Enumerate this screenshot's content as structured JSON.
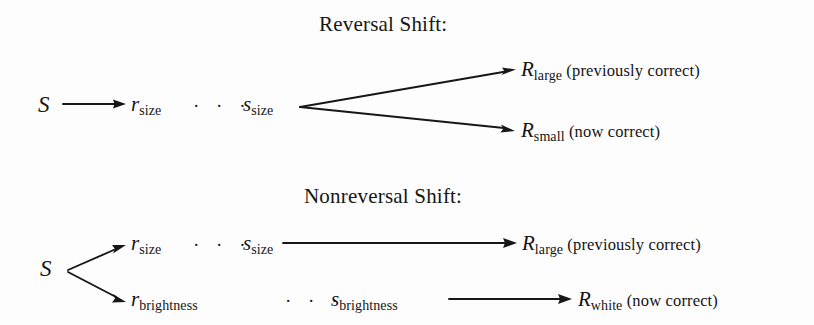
{
  "figure": {
    "background_color": "#fdfdfd",
    "ink_color": "#171717",
    "type": "diagram"
  },
  "sections": [
    {
      "id": "reversal",
      "title": "Reversal Shift:",
      "stimulus_label": "S",
      "mediators": [
        {
          "id": "size-chain",
          "r_base": "r",
          "r_sub": "size",
          "dots": "· · ·",
          "s_base": "s",
          "s_sub": "size"
        }
      ],
      "responses": [
        {
          "id": "r-large",
          "base": "R",
          "sub": "large",
          "note": "(previously correct)"
        },
        {
          "id": "r-small",
          "base": "R",
          "sub": "small",
          "note": "(now correct)"
        }
      ]
    },
    {
      "id": "nonreversal",
      "title": "Nonreversal Shift:",
      "stimulus_label": "S",
      "mediators": [
        {
          "id": "size-chain",
          "r_base": "r",
          "r_sub": "size",
          "dots": "· · ·",
          "s_base": "s",
          "s_sub": "size"
        },
        {
          "id": "brightness-chain",
          "r_base": "r",
          "r_sub": "brightness",
          "dots": "· · ·",
          "s_base": "s",
          "s_sub": "brightness"
        }
      ],
      "responses": [
        {
          "id": "r-large",
          "base": "R",
          "sub": "large",
          "note": "(previously correct)"
        },
        {
          "id": "r-white",
          "base": "R",
          "sub": "white",
          "note": "(now correct)"
        }
      ]
    }
  ]
}
